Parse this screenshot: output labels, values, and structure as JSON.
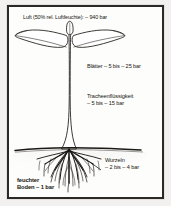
{
  "figure": {
    "language": "de",
    "border_color": "#2b2926",
    "ink_color": "#17150f",
    "paper_color": "#fdfdfc"
  },
  "labels": {
    "air": "Luft (50% rel. Luftfeuchte): – 940 bar",
    "leaves": "Blätter  – 5 bis – 25 bar",
    "tracheal_line1": "Tracheenflüssigkeit",
    "tracheal_line2": "– 5 bis – 15 bar",
    "roots_line1": "Wurzeln",
    "roots_line2": "– 2 bis – 4 bar",
    "soil_line1": "feuchter",
    "soil_line2": "Boden  – 1 bar"
  },
  "diagram_parts": {
    "leaf_left": "leaf-left",
    "leaf_right": "leaf-right",
    "shoot_tip": "shoot-tip",
    "stem": "stem",
    "soil_line": "soil-line",
    "roots": "root-system",
    "pointer_roots": "roots-pointer-line"
  },
  "values": {
    "air_bar": -940,
    "leaves_bar_min": -5,
    "leaves_bar_max": -25,
    "tracheal_bar_min": -5,
    "tracheal_bar_max": -15,
    "roots_bar_min": -2,
    "roots_bar_max": -4,
    "soil_bar": -1,
    "relative_humidity_percent": 50
  }
}
